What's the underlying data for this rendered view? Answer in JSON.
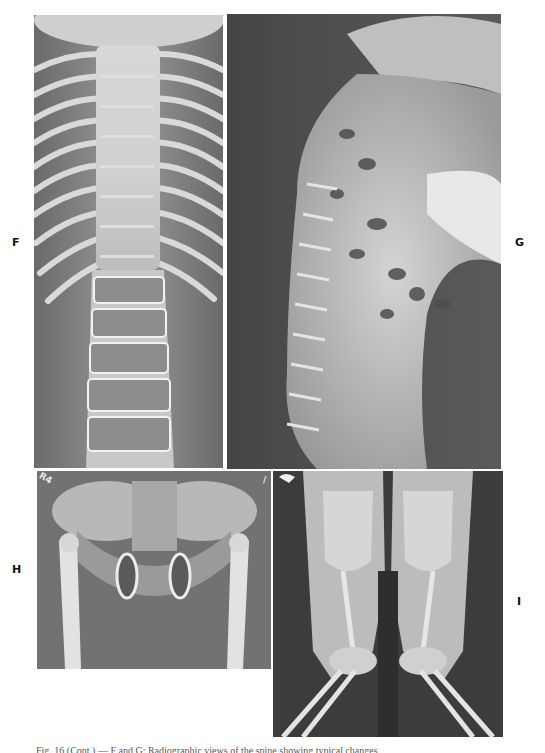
{
  "figure": {
    "panels": [
      {
        "id": "F",
        "label": "F",
        "description": "Frontal radiograph of thoracolumbar spine and ribs"
      },
      {
        "id": "G",
        "label": "G",
        "description": "Lateral radiograph of spine showing kyphosis"
      },
      {
        "id": "H",
        "label": "H",
        "description": "Frontal radiograph of pelvis and hips"
      },
      {
        "id": "I",
        "label": "I",
        "description": "Frontal radiograph of femurs, knees and lower legs"
      }
    ],
    "film_marks": {
      "H_top_left": "R4",
      "H_top_right": "/",
      "I_top_left": "⌁"
    },
    "caption": "Fig. 16 (Cont.) — F and G: Radiographic views of the spine showing typical changes"
  },
  "colors": {
    "page_background": "#ffffff",
    "label_text": "#111111",
    "film_dark": "#3a3a3a",
    "film_mid": "#8a8a8a",
    "bone_light": "#e6e6e6"
  }
}
